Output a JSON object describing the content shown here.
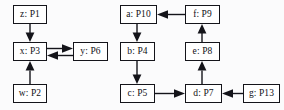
{
  "diagram": {
    "type": "directed-graph",
    "background_color": "#fbfbfc",
    "node_fill_color": "#ffffff",
    "node_border_color": "#14141a",
    "edge_color": "#14141a",
    "nodes": [
      {
        "id": "p1",
        "label": "z: P1",
        "variable": "z",
        "process": "P1",
        "cluster": "left"
      },
      {
        "id": "p3",
        "label": "x: P3",
        "variable": "x",
        "process": "P3",
        "cluster": "left"
      },
      {
        "id": "p2",
        "label": "w: P2",
        "variable": "w",
        "process": "P2",
        "cluster": "left"
      },
      {
        "id": "p6",
        "label": "y: P6",
        "variable": "y",
        "process": "P6",
        "cluster": "left"
      },
      {
        "id": "p10",
        "label": "a: P10",
        "variable": "a",
        "process": "P10",
        "cluster": "right"
      },
      {
        "id": "p9",
        "label": "f: P9",
        "variable": "f",
        "process": "P9",
        "cluster": "right"
      },
      {
        "id": "p4",
        "label": "b: P4",
        "variable": "b",
        "process": "P4",
        "cluster": "right"
      },
      {
        "id": "p8",
        "label": "e: P8",
        "variable": "e",
        "process": "P8",
        "cluster": "right"
      },
      {
        "id": "p5",
        "label": "c: P5",
        "variable": "c",
        "process": "P5",
        "cluster": "right"
      },
      {
        "id": "p7",
        "label": "d: P7",
        "variable": "d",
        "process": "P7",
        "cluster": "right"
      },
      {
        "id": "p13",
        "label": "g: P13",
        "variable": "g",
        "process": "P13",
        "cluster": "right"
      }
    ],
    "edges": [
      {
        "from": "p1",
        "to": "p3",
        "direction": "down"
      },
      {
        "from": "p2",
        "to": "p3",
        "direction": "up"
      },
      {
        "from": "p3",
        "to": "p6",
        "direction": "right"
      },
      {
        "from": "p6",
        "to": "p3",
        "direction": "left"
      },
      {
        "from": "p10",
        "to": "p4",
        "direction": "down"
      },
      {
        "from": "p4",
        "to": "p5",
        "direction": "down"
      },
      {
        "from": "p5",
        "to": "p7",
        "direction": "right"
      },
      {
        "from": "p7",
        "to": "p8",
        "direction": "up"
      },
      {
        "from": "p8",
        "to": "p9",
        "direction": "up"
      },
      {
        "from": "p9",
        "to": "p10",
        "direction": "left"
      },
      {
        "from": "p13",
        "to": "p7",
        "direction": "left"
      }
    ]
  }
}
